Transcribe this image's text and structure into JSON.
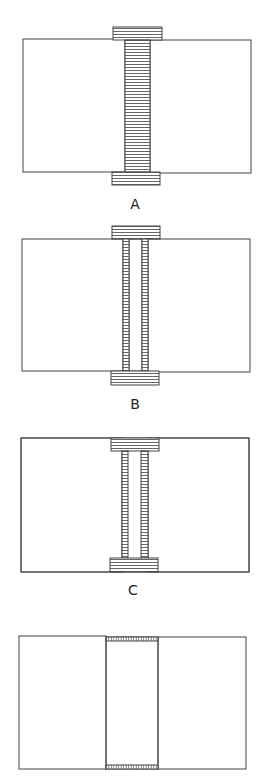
{
  "figure": {
    "width": 267,
    "height": 780,
    "stroke_color": "#444444",
    "hatch_color": "#555555",
    "background": "#ffffff"
  },
  "panels": [
    {
      "id": "A",
      "label": "A",
      "label_pos": [
        135,
        204
      ],
      "left_block": {
        "x": 23,
        "y": 39,
        "w": 102,
        "h": 133
      },
      "right_block": {
        "x": 150,
        "y": 40,
        "w": 101,
        "h": 133
      },
      "hatched_parts": [
        {
          "name": "top-cap",
          "x": 113,
          "y": 27,
          "w": 49,
          "h": 13,
          "hatch": "horizontal"
        },
        {
          "name": "stem",
          "x": 125,
          "y": 40,
          "w": 25,
          "h": 132,
          "hatch": "horizontal"
        },
        {
          "name": "bottom-cap",
          "x": 112,
          "y": 172,
          "w": 48,
          "h": 13,
          "hatch": "horizontal"
        }
      ],
      "outlines": []
    },
    {
      "id": "B",
      "label": "B",
      "label_pos": [
        135,
        404
      ],
      "left_block": {
        "x": 22,
        "y": 239,
        "w": 101,
        "h": 132
      },
      "right_block": {
        "x": 148,
        "y": 239,
        "w": 102,
        "h": 133
      },
      "hatched_parts": [
        {
          "name": "top-cap",
          "x": 112,
          "y": 226,
          "w": 48,
          "h": 13,
          "hatch": "horizontal"
        },
        {
          "name": "left-strip",
          "x": 123,
          "y": 239,
          "w": 6,
          "h": 132,
          "hatch": "horizontal"
        },
        {
          "name": "right-strip",
          "x": 142,
          "y": 239,
          "w": 6,
          "h": 132,
          "hatch": "horizontal"
        },
        {
          "name": "bottom-cap",
          "x": 111,
          "y": 371,
          "w": 48,
          "h": 14,
          "hatch": "horizontal"
        }
      ],
      "outlines": [
        {
          "x": 129,
          "y": 239,
          "w": 13,
          "h": 132
        }
      ]
    },
    {
      "id": "C",
      "label": "C",
      "label_pos": [
        133,
        590
      ],
      "left_block": {
        "x": 21,
        "y": 438,
        "w": 101,
        "h": 134
      },
      "right_block": {
        "x": 148,
        "y": 438,
        "w": 101,
        "h": 134
      },
      "hatched_parts": [
        {
          "name": "top-cap",
          "x": 111,
          "y": 438,
          "w": 48,
          "h": 13,
          "hatch": "horizontal"
        },
        {
          "name": "left-strip",
          "x": 122,
          "y": 451,
          "w": 6,
          "h": 107,
          "hatch": "horizontal"
        },
        {
          "name": "right-strip",
          "x": 141,
          "y": 451,
          "w": 7,
          "h": 107,
          "hatch": "horizontal"
        },
        {
          "name": "bottom-cap",
          "x": 110,
          "y": 558,
          "w": 48,
          "h": 14,
          "hatch": "horizontal"
        }
      ],
      "outlines": [
        {
          "x": 21,
          "y": 438,
          "w": 228,
          "h": 134
        }
      ]
    },
    {
      "id": "D",
      "label": "",
      "label_pos": [
        133,
        790
      ],
      "left_block": {
        "x": 19,
        "y": 636,
        "w": 87,
        "h": 133
      },
      "right_block": {
        "x": 158,
        "y": 637,
        "w": 88,
        "h": 132
      },
      "hatched_parts": [
        {
          "name": "top-strip",
          "x": 106,
          "y": 637,
          "w": 52,
          "h": 4,
          "hatch": "vertical"
        },
        {
          "name": "bottom-strip",
          "x": 106,
          "y": 765,
          "w": 52,
          "h": 4,
          "hatch": "vertical"
        }
      ],
      "outlines": [
        {
          "x": 106,
          "y": 637,
          "w": 52,
          "h": 132
        }
      ]
    }
  ]
}
